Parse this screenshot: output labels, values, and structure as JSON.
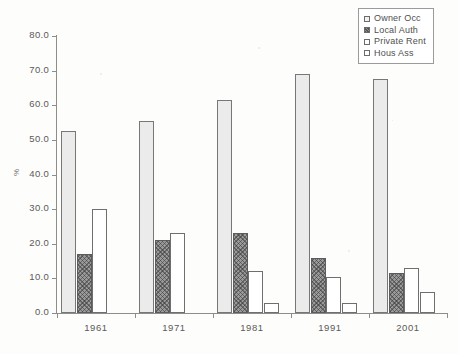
{
  "chart_data": {
    "type": "bar",
    "title": "",
    "xlabel": "",
    "ylabel": "%",
    "ylim": [
      0,
      80
    ],
    "ytick_step": 10,
    "ytick_labels": [
      "0.0",
      "10.0",
      "20.0",
      "30.0",
      "40.0",
      "50.0",
      "60.0",
      "70.0",
      "80.0"
    ],
    "ytick_values": [
      0,
      10,
      20,
      30,
      40,
      50,
      60,
      70,
      80
    ],
    "grid": false,
    "legend_position": "top-right",
    "categories": [
      "1961",
      "1971",
      "1981",
      "1991",
      "2001"
    ],
    "series": [
      {
        "name": "Owner Occ",
        "values": [
          52.5,
          55.5,
          61.5,
          69.0,
          67.5
        ]
      },
      {
        "name": "Local Auth",
        "values": [
          17.0,
          21.0,
          23.0,
          16.0,
          11.5
        ]
      },
      {
        "name": "Private Rent",
        "values": [
          30.0,
          23.0,
          12.0,
          10.5,
          13.0
        ]
      },
      {
        "name": "Hous Ass",
        "values": [
          null,
          null,
          3.0,
          3.0,
          6.0
        ]
      }
    ]
  },
  "legend": {
    "items": [
      {
        "label": "Owner Occ"
      },
      {
        "label": "Local Auth"
      },
      {
        "label": "Private Rent"
      },
      {
        "label": "Hous Ass"
      }
    ]
  }
}
